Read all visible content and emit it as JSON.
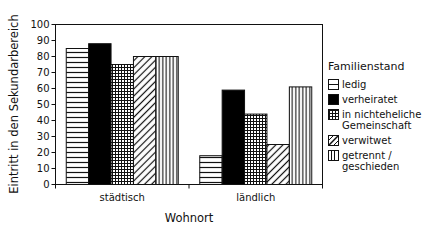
{
  "chart_data": {
    "type": "bar",
    "title": "",
    "xlabel": "Wohnort",
    "ylabel": "Eintritt in den Sekundarbereich",
    "ylim": [
      0,
      100
    ],
    "yticks": [
      0,
      10,
      20,
      30,
      40,
      50,
      60,
      70,
      80,
      90,
      100
    ],
    "grid": false,
    "legend_position": "right",
    "legend_title": "Familienstand",
    "categories": [
      "städtisch",
      "ländlich"
    ],
    "series": [
      {
        "name": "ledig",
        "pattern": "horizontal-lines",
        "values": [
          85,
          18
        ]
      },
      {
        "name": "verheiratet",
        "pattern": "solid-black",
        "values": [
          88,
          59
        ]
      },
      {
        "name": "in nichteheliche Gemeinschaft",
        "pattern": "grid",
        "values": [
          75,
          44
        ]
      },
      {
        "name": "verwitwet",
        "pattern": "diagonal-lines",
        "values": [
          80,
          25
        ]
      },
      {
        "name": "getrennt / geschieden",
        "pattern": "vertical-lines",
        "values": [
          80,
          61
        ]
      }
    ]
  },
  "legend": {
    "title": "Familienstand",
    "items": [
      {
        "label": "ledig",
        "pattern": "horizontal-lines"
      },
      {
        "label": "verheiratet",
        "pattern": "solid-black"
      },
      {
        "label": "in nichteheliche\nGemeinschaft",
        "pattern": "grid"
      },
      {
        "label": "verwitwet",
        "pattern": "diagonal-lines"
      },
      {
        "label": "getrennt /\ngeschieden",
        "pattern": "vertical-lines"
      }
    ]
  },
  "colors": {
    "ink": "#111111",
    "background": "#ffffff"
  }
}
